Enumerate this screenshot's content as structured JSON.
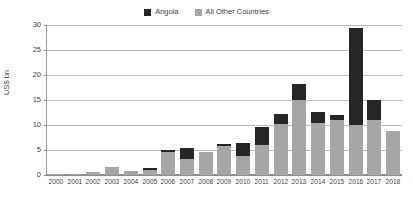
{
  "chart_data": {
    "type": "bar",
    "stacked": true,
    "title": "",
    "subtitle": "",
    "xlabel": "",
    "ylabel": "US$ bn",
    "ylim": [
      0,
      30
    ],
    "ytick_labels": [
      "0",
      "5",
      "10",
      "15",
      "20",
      "25",
      "30"
    ],
    "yticks": [
      0,
      5,
      10,
      15,
      20,
      25,
      30
    ],
    "grid": true,
    "legend_position": "top-center",
    "categories": [
      "2000",
      "2001",
      "2002",
      "2003",
      "2004",
      "2005",
      "2006",
      "2007",
      "2008",
      "2009",
      "2010",
      "2011",
      "2012",
      "2013",
      "2014",
      "2015",
      "2016",
      "2017",
      "2018"
    ],
    "series": [
      {
        "name": "Angola",
        "color": "#262626",
        "values": [
          0.0,
          0.0,
          0.0,
          0.0,
          0.0,
          0.3,
          0.4,
          2.2,
          0.0,
          0.4,
          2.6,
          3.5,
          1.9,
          3.2,
          2.1,
          1.0,
          19.4,
          4.0,
          0.0
        ]
      },
      {
        "name": "All Other Countries",
        "color": "#a6a6a6",
        "values": [
          0.2,
          0.2,
          0.7,
          1.7,
          0.9,
          1.1,
          4.7,
          3.3,
          4.6,
          5.8,
          3.9,
          6.1,
          10.3,
          15.0,
          10.5,
          11.0,
          10.0,
          11.0,
          8.9
        ]
      }
    ],
    "totals": [
      0.2,
      0.2,
      0.7,
      1.7,
      0.9,
      1.4,
      5.1,
      5.5,
      4.6,
      6.2,
      6.5,
      9.6,
      12.2,
      18.2,
      12.6,
      12.0,
      29.4,
      15.0,
      8.9
    ]
  },
  "legend": {
    "items": [
      {
        "label": "Angola",
        "color": "#262626"
      },
      {
        "label": "All Other Countries",
        "color": "#a6a6a6"
      }
    ]
  }
}
